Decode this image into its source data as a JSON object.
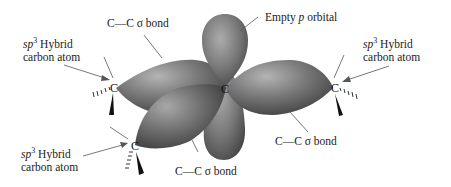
{
  "diagram": {
    "central_atom": "C",
    "colors": {
      "lobe_dark": "#3e3e3e",
      "lobe_mid": "#6e6e6e",
      "lobe_light": "#a8a8a8",
      "text": "#222222",
      "leader_line": "#555555"
    },
    "atoms": [
      {
        "id": "center",
        "symbol": "C"
      },
      {
        "id": "left",
        "symbol": "C"
      },
      {
        "id": "right",
        "symbol": "C"
      },
      {
        "id": "bottom",
        "symbol": "C"
      }
    ],
    "labels": {
      "empty_p": {
        "prefix": "Empty ",
        "italic": "p",
        "suffix": " orbital"
      },
      "bond_top": {
        "text": "C—C σ bond"
      },
      "bond_bottom_mid": {
        "text": "C—C σ bond"
      },
      "bond_right": {
        "text": "C—C σ bond"
      },
      "hybrid_left": {
        "italic": "sp",
        "sup": "3",
        "line1_suffix": " Hybrid",
        "line2": "carbon atom"
      },
      "hybrid_right": {
        "italic": "sp",
        "sup": "3",
        "line1_suffix": " Hybrid",
        "line2": "carbon atom"
      },
      "hybrid_bottom": {
        "italic": "sp",
        "sup": "3",
        "line1_suffix": " Hybrid",
        "line2": "carbon atom"
      }
    }
  }
}
